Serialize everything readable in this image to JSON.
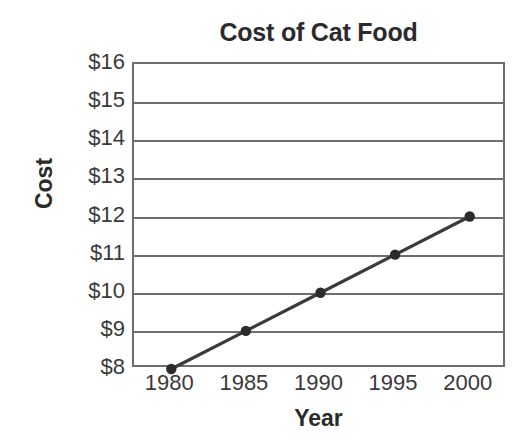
{
  "chart_data": {
    "type": "line",
    "title": "Cost of Cat Food",
    "xlabel": "Year",
    "ylabel": "Cost",
    "x": [
      1980,
      1985,
      1990,
      1995,
      2000
    ],
    "categories": [
      "1980",
      "1985",
      "1990",
      "1995",
      "2000"
    ],
    "values": [
      8,
      9,
      10,
      11,
      12
    ],
    "series": [
      {
        "name": "Cost of Cat Food",
        "values": [
          8,
          9,
          10,
          11,
          12
        ]
      }
    ],
    "xtick_labels": [
      "1980",
      "1985",
      "1990",
      "1995",
      "2000"
    ],
    "ytick_labels": [
      "$8",
      "$9",
      "$10",
      "$11",
      "$12",
      "$13",
      "$14",
      "$15",
      "$16"
    ],
    "ytick_values": [
      8,
      9,
      10,
      11,
      12,
      13,
      14,
      15,
      16
    ],
    "ylim": [
      8,
      16
    ],
    "xlim": [
      1977.5,
      2002.5
    ],
    "grid": true,
    "grid_axis": "y",
    "legend": false,
    "legend_position": "none",
    "point_labels": [
      "$8",
      "$9",
      "$10",
      "$11",
      "$12"
    ],
    "colors": {
      "line": "#3a3a3a",
      "marker": "#2b2b2b",
      "grid": "#6e6e6e",
      "axis": "#6e6e6e",
      "text": "#3a3a3a",
      "title_text": "#2b2b2b",
      "background": "#ffffff"
    }
  }
}
